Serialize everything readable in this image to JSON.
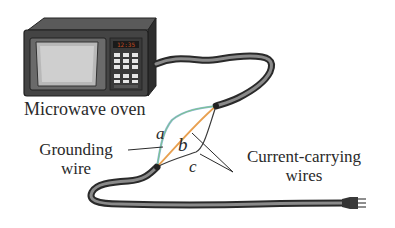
{
  "figure": {
    "device": "microwave oven",
    "labels": {
      "microwave": "Microwave oven",
      "grounding_line1": "Grounding",
      "grounding_line2": "wire",
      "current_line1": "Current-carrying",
      "current_line2": "wires",
      "a": "a",
      "b": "b",
      "c": "c"
    },
    "wire_colors": {
      "grounding_a": "#7cc58a",
      "a_blue": "#8fb8d8",
      "current_b": "#e8a050",
      "current_c": "#3a3a3a"
    },
    "cord_color": "#4a4a4a",
    "oven_body_color": "#3e3e3e",
    "display_color": "#b04020"
  }
}
